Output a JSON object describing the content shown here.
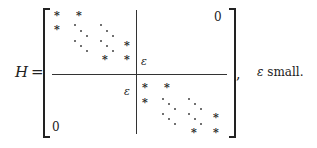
{
  "equation": {
    "lhs_symbol": "H",
    "equals": "=",
    "star": "*",
    "epsilon": "ε",
    "zero_top_right": "0",
    "zero_bottom_left": "0",
    "trailing_comma": ",",
    "note_symbol": "ε",
    "note_text": " small."
  },
  "structure": {
    "type": "block matrix",
    "blocks": [
      {
        "position": "top-left",
        "content": "upper Hessenberg-like block of * with dotted diagonals"
      },
      {
        "position": "top-right",
        "content": "ε at lower-left corner, 0 elsewhere"
      },
      {
        "position": "bottom-left",
        "content": "ε at upper-right corner, 0 elsewhere"
      },
      {
        "position": "bottom-right",
        "content": "upper Hessenberg-like block of * with dotted diagonals"
      }
    ]
  }
}
